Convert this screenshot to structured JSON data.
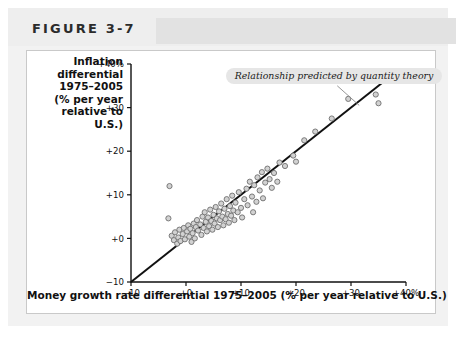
{
  "figure": {
    "title": "FIGURE 3-7"
  },
  "annotation": {
    "text": "Relationship predicted by quantity theory"
  },
  "chart_data": {
    "type": "scatter",
    "title": "FIGURE 3-7",
    "xlabel": "Money growth rate differential 1975–2005 (% per year relative to U.S.)",
    "ylabel": "Inflation differential 1975–2005 (% per year relative to U.S.)",
    "ylabel_lines": [
      "Inflation",
      "differential",
      "1975–2005",
      "(% per year",
      "relative to",
      "U.S.)"
    ],
    "xlim": [
      -10,
      40
    ],
    "ylim": [
      -10,
      40
    ],
    "xticks": [
      -10,
      0,
      10,
      20,
      30,
      40
    ],
    "yticks": [
      -10,
      0,
      10,
      20,
      30,
      40
    ],
    "xticklabels": [
      "−10",
      "+0",
      "+10",
      "+20",
      "+30",
      "+40%"
    ],
    "yticklabels": [
      "−10",
      "+0",
      "+10",
      "+20",
      "+30",
      "+40%"
    ],
    "grid": false,
    "legend": false,
    "marker": {
      "shape": "circle",
      "radius_px": 2.6,
      "fill": "#d2d2d2",
      "stroke": "#6f6f6f"
    },
    "reference_line": {
      "label": "Relationship predicted by quantity theory",
      "slope": 1,
      "intercept": 0,
      "from": [
        -10,
        -10
      ],
      "to": [
        38.5,
        38.5
      ],
      "color": "#111111"
    },
    "annotations": [
      {
        "text": "Relationship predicted by quantity theory",
        "x": 14.5,
        "y": 37.5,
        "style": "rounded-gray-box-italic",
        "leader_from": [
          27.5,
          35.0
        ],
        "leader_to": [
          31.5,
          30.5
        ]
      }
    ],
    "points": [
      [
        -3.2,
        4.6
      ],
      [
        -2.6,
        0.6
      ],
      [
        -2.2,
        -0.4
      ],
      [
        -2.0,
        1.4
      ],
      [
        -1.6,
        -1.2
      ],
      [
        -1.4,
        0.2
      ],
      [
        -1.2,
        2.0
      ],
      [
        -1.0,
        -0.6
      ],
      [
        -0.6,
        1.0
      ],
      [
        -0.4,
        2.4
      ],
      [
        -0.2,
        -0.2
      ],
      [
        0.2,
        1.6
      ],
      [
        0.4,
        3.0
      ],
      [
        0.6,
        0.4
      ],
      [
        0.8,
        2.2
      ],
      [
        1.0,
        -0.8
      ],
      [
        1.2,
        1.2
      ],
      [
        1.4,
        3.4
      ],
      [
        1.6,
        0.0
      ],
      [
        1.8,
        2.6
      ],
      [
        2.0,
        4.2
      ],
      [
        2.2,
        1.8
      ],
      [
        2.6,
        3.2
      ],
      [
        2.8,
        0.8
      ],
      [
        3.0,
        5.0
      ],
      [
        3.2,
        2.4
      ],
      [
        3.4,
        6.0
      ],
      [
        3.6,
        3.8
      ],
      [
        3.8,
        1.6
      ],
      [
        4.0,
        4.8
      ],
      [
        4.2,
        2.8
      ],
      [
        4.4,
        6.6
      ],
      [
        4.6,
        4.0
      ],
      [
        4.8,
        2.0
      ],
      [
        5.0,
        5.4
      ],
      [
        5.2,
        3.4
      ],
      [
        5.4,
        7.2
      ],
      [
        5.6,
        4.6
      ],
      [
        5.8,
        2.6
      ],
      [
        6.0,
        6.2
      ],
      [
        6.2,
        4.2
      ],
      [
        6.4,
        8.0
      ],
      [
        6.6,
        5.0
      ],
      [
        6.8,
        3.0
      ],
      [
        7.0,
        6.8
      ],
      [
        7.2,
        4.4
      ],
      [
        7.4,
        9.0
      ],
      [
        7.6,
        5.6
      ],
      [
        7.8,
        3.6
      ],
      [
        8.0,
        7.4
      ],
      [
        8.2,
        5.2
      ],
      [
        8.4,
        9.8
      ],
      [
        8.6,
        6.4
      ],
      [
        8.8,
        4.2
      ],
      [
        9.0,
        8.2
      ],
      [
        9.4,
        6.0
      ],
      [
        9.6,
        10.6
      ],
      [
        10.0,
        7.0
      ],
      [
        10.2,
        4.8
      ],
      [
        10.6,
        9.0
      ],
      [
        11.0,
        11.4
      ],
      [
        11.2,
        7.6
      ],
      [
        11.6,
        13.0
      ],
      [
        12.0,
        9.6
      ],
      [
        12.4,
        12.2
      ],
      [
        12.8,
        8.4
      ],
      [
        13.0,
        14.0
      ],
      [
        13.4,
        11.0
      ],
      [
        13.8,
        15.2
      ],
      [
        14.0,
        9.2
      ],
      [
        14.4,
        12.8
      ],
      [
        14.8,
        16.0
      ],
      [
        15.2,
        13.6
      ],
      [
        15.6,
        11.6
      ],
      [
        16.0,
        15.0
      ],
      [
        16.6,
        13.0
      ],
      [
        17.0,
        17.4
      ],
      [
        12.2,
        6.0
      ],
      [
        -3.0,
        12.0
      ],
      [
        19.5,
        19.0
      ],
      [
        21.5,
        22.5
      ],
      [
        23.5,
        24.5
      ],
      [
        26.5,
        27.5
      ],
      [
        29.5,
        32.0
      ],
      [
        34.5,
        33.0
      ],
      [
        35.0,
        31.0
      ],
      [
        18.0,
        16.6
      ],
      [
        20.0,
        17.6
      ]
    ]
  }
}
